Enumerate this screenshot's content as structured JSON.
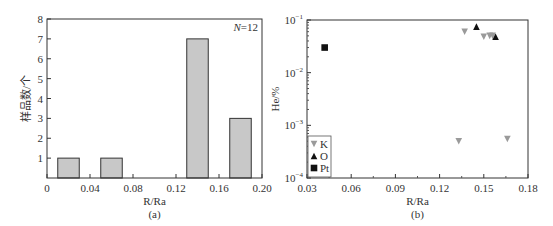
{
  "chart_data": [
    {
      "type": "bar",
      "panel_label": "(a)",
      "title": "",
      "xlabel": "R/Ra",
      "ylabel": "样品数/个",
      "annotation": "N=12",
      "annotation_n": "N",
      "annotation_val": "=12",
      "xlim": [
        0,
        0.2
      ],
      "ylim": [
        0,
        8
      ],
      "xticks": [
        "0",
        "0.04",
        "0.08",
        "0.12",
        "0.16",
        "0.20"
      ],
      "yticks": [
        "1",
        "2",
        "3",
        "4",
        "5",
        "6",
        "7",
        "8"
      ],
      "bins": [
        [
          0.01,
          0.03
        ],
        [
          0.05,
          0.07
        ],
        [
          0.13,
          0.15
        ],
        [
          0.17,
          0.19
        ]
      ],
      "categories": [
        "0.01-0.03",
        "0.05-0.07",
        "0.13-0.15",
        "0.17-0.19"
      ],
      "values": [
        1,
        1,
        7,
        3
      ],
      "bar_color": "#c8c8c8",
      "grid": false
    },
    {
      "type": "scatter",
      "panel_label": "(b)",
      "title": "",
      "xlabel": "R/Ra",
      "ylabel": "He/%",
      "xlim": [
        0.03,
        0.18
      ],
      "ylim": [
        0.0001,
        0.1
      ],
      "yscale": "log",
      "xticks": [
        "0.03",
        "0.06",
        "0.09",
        "0.12",
        "0.15",
        "0.18"
      ],
      "yticks": [
        "10⁻⁴",
        "10⁻³",
        "10⁻²",
        "10⁻¹"
      ],
      "ytick_base": "10",
      "ytick_exps": [
        "-4",
        "-3",
        "-2",
        "-1"
      ],
      "legend_position": "lower left",
      "grid": false,
      "series": [
        {
          "name": "K",
          "marker": "triangle-down",
          "color": "#9a9a9a",
          "points": [
            [
              0.133,
              0.0005
            ],
            [
              0.137,
              0.06
            ],
            [
              0.15,
              0.048
            ],
            [
              0.154,
              0.05
            ],
            [
              0.156,
              0.05
            ],
            [
              0.166,
              0.00055
            ]
          ]
        },
        {
          "name": "O",
          "marker": "triangle-up",
          "color": "#111111",
          "points": [
            [
              0.145,
              0.075
            ],
            [
              0.158,
              0.048
            ]
          ]
        },
        {
          "name": "Pt",
          "marker": "square",
          "color": "#111111",
          "points": [
            [
              0.042,
              0.03
            ]
          ]
        }
      ]
    }
  ]
}
